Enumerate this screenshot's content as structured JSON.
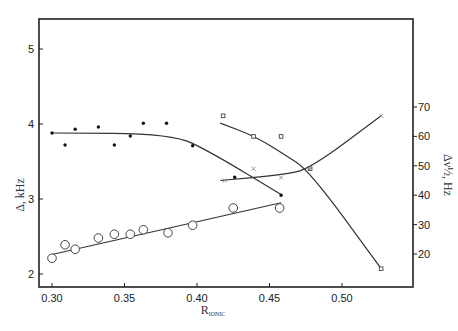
{
  "chart_data": {
    "type": "scatter",
    "title": "",
    "xlabel": "R_IONIC",
    "ylabel": "Δ, kHz",
    "ylabel_right": "Δν½, Hz",
    "xlim": [
      0.29,
      0.55
    ],
    "ylim": [
      1.82,
      5.4
    ],
    "ylim_right": [
      13,
      92
    ],
    "xticks": [
      "0.30",
      "0.35",
      "0.40",
      "0.45",
      "0.50"
    ],
    "yticks": [
      "2",
      "3",
      "4",
      "5"
    ],
    "yticks_right": [
      "20",
      "30",
      "40",
      "50",
      "60",
      "70"
    ],
    "grid": false,
    "legend": null,
    "series": [
      {
        "name": "Δ (filled dots)",
        "axis": "left",
        "marker": "dot",
        "x": [
          0.3,
          0.309,
          0.316,
          0.332,
          0.343,
          0.354,
          0.363,
          0.379,
          0.397,
          0.426,
          0.458
        ],
        "y": [
          3.88,
          3.72,
          3.93,
          3.96,
          3.72,
          3.84,
          4.01,
          4.01,
          3.71,
          3.29,
          3.05
        ]
      },
      {
        "name": "Δ (open circles)",
        "axis": "left",
        "marker": "circle",
        "x": [
          0.3,
          0.309,
          0.316,
          0.332,
          0.343,
          0.354,
          0.363,
          0.38,
          0.397,
          0.425,
          0.457
        ],
        "y": [
          2.21,
          2.39,
          2.33,
          2.48,
          2.53,
          2.53,
          2.59,
          2.55,
          2.65,
          2.88,
          2.88
        ]
      },
      {
        "name": "Δν½ (squares)",
        "axis": "right",
        "marker": "square",
        "x": [
          0.418,
          0.439,
          0.458,
          0.478,
          0.527
        ],
        "y": [
          67,
          60,
          60,
          49,
          15
        ]
      },
      {
        "name": "Δν½ (crosses)",
        "axis": "right",
        "marker": "cross",
        "x": [
          0.419,
          0.439,
          0.458,
          0.478,
          0.527
        ],
        "y": [
          45,
          49,
          46,
          49,
          67
        ]
      }
    ],
    "fit_lines": [
      {
        "series": "Δ (filled dots)",
        "points": [
          [
            0.3,
            3.88
          ],
          [
            0.383,
            3.87
          ],
          [
            0.41,
            3.62
          ],
          [
            0.458,
            3.06
          ]
        ]
      },
      {
        "series": "Δ (open circles)",
        "points": [
          [
            0.3,
            2.26
          ],
          [
            0.458,
            2.95
          ]
        ]
      },
      {
        "series": "Δν½ (squares)",
        "points": [
          [
            0.416,
            64.5
          ],
          [
            0.44,
            60
          ],
          [
            0.46,
            54
          ],
          [
            0.478,
            48
          ],
          [
            0.527,
            15
          ]
        ]
      },
      {
        "series": "Δν½ (crosses)",
        "points": [
          [
            0.416,
            45
          ],
          [
            0.46,
            47
          ],
          [
            0.478,
            49
          ],
          [
            0.527,
            67
          ]
        ]
      }
    ]
  }
}
